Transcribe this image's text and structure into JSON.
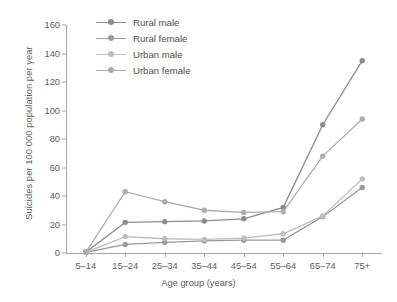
{
  "chart_data": {
    "type": "line",
    "title": "",
    "xlabel": "Age group (years)",
    "ylabel": "Suicides per 100 000 population per year",
    "categories": [
      "5–14",
      "15–24",
      "25–34",
      "35–44",
      "45–54",
      "55–64",
      "65–74",
      "75+"
    ],
    "ylim": [
      0,
      160
    ],
    "yticks": [
      0,
      20,
      40,
      60,
      80,
      100,
      120,
      140,
      160
    ],
    "grid": false,
    "legend_position": "top-left",
    "series": [
      {
        "name": "Rural male",
        "color": "#8c8c8c",
        "values": [
          0.5,
          21.5,
          22,
          22.5,
          24,
          32,
          90,
          135
        ]
      },
      {
        "name": "Rural female",
        "color": "#9a9a9a",
        "values": [
          0.5,
          6,
          7.5,
          8.5,
          9,
          9,
          25.5,
          46
        ]
      },
      {
        "name": "Urban male",
        "color": "#bdbdbd",
        "values": [
          0.5,
          11.5,
          10,
          9.5,
          10.5,
          13.5,
          26,
          52
        ]
      },
      {
        "name": "Urban female",
        "color": "#adadad",
        "values": [
          0.5,
          43,
          36,
          30,
          28.5,
          29,
          68,
          94
        ]
      }
    ]
  }
}
